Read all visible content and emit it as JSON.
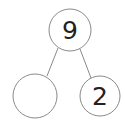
{
  "diagram": {
    "type": "number-bond",
    "whole": {
      "value": "9"
    },
    "parts": [
      {
        "value": ""
      },
      {
        "value": "2"
      }
    ],
    "stroke_color": "#8a8a8a",
    "text_color": "#222222"
  }
}
